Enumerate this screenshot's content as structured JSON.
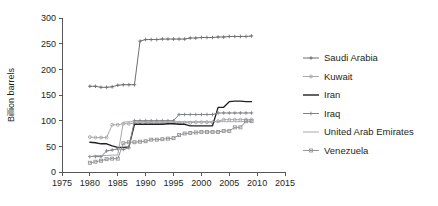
{
  "chart_data": {
    "type": "line",
    "title": "",
    "xlabel": "",
    "ylabel": "Billion barrels",
    "xlim": [
      1975,
      2015
    ],
    "ylim": [
      0,
      300
    ],
    "xticks": [
      1975,
      1980,
      1985,
      1990,
      1995,
      2000,
      2005,
      2010,
      2015
    ],
    "yticks": [
      0,
      50,
      100,
      150,
      200,
      250,
      300
    ],
    "grid": false,
    "legend_position": "right",
    "x": [
      1980,
      1981,
      1982,
      1983,
      1984,
      1985,
      1986,
      1987,
      1988,
      1989,
      1990,
      1991,
      1992,
      1993,
      1994,
      1995,
      1996,
      1997,
      1998,
      1999,
      2000,
      2001,
      2002,
      2003,
      2004,
      2005,
      2006,
      2007,
      2008,
      2009
    ],
    "series": [
      {
        "name": "Saudi Arabia",
        "color": "#6d6e71",
        "marker": "plus",
        "values": [
          167,
          167,
          165,
          165,
          166,
          169,
          170,
          170,
          170,
          255,
          258,
          258,
          258,
          259,
          259,
          259,
          259,
          259,
          261,
          261,
          262,
          262,
          262,
          263,
          263,
          264,
          264,
          264,
          264,
          265
        ]
      },
      {
        "name": "Kuwait",
        "color": "#a7a9ac",
        "marker": "dot",
        "values": [
          68,
          67,
          67,
          67,
          92,
          92,
          94,
          94,
          95,
          97,
          97,
          96,
          96,
          96,
          96,
          96,
          96,
          96,
          96,
          97,
          97,
          97,
          97,
          99,
          102,
          102,
          102,
          102,
          102,
          102
        ]
      },
      {
        "name": "Iran",
        "color": "#231f20",
        "marker": "none",
        "values": [
          58,
          57,
          55,
          55,
          51,
          48,
          48,
          49,
          93,
          93,
          93,
          93,
          93,
          93,
          94,
          94,
          93,
          93,
          90,
          90,
          90,
          90,
          90,
          126,
          126,
          137,
          138,
          138,
          137,
          137
        ]
      },
      {
        "name": "Iraq",
        "color": "#808285",
        "marker": "plus",
        "values": [
          30,
          30,
          30,
          41,
          43,
          45,
          44,
          47,
          100,
          100,
          100,
          100,
          100,
          100,
          100,
          100,
          112,
          112,
          112,
          112,
          112,
          112,
          112,
          115,
          115,
          115,
          115,
          115,
          115,
          115
        ]
      },
      {
        "name": "United Arab Emirates",
        "color": "#a7a9ac",
        "marker": "none",
        "values": [
          30,
          32,
          32,
          32,
          33,
          33,
          97,
          98,
          98,
          98,
          98,
          98,
          98,
          98,
          98,
          98,
          98,
          98,
          98,
          98,
          98,
          98,
          98,
          98,
          98,
          98,
          98,
          98,
          98,
          98
        ]
      },
      {
        "name": "Venezuela",
        "color": "#939598",
        "marker": "square",
        "values": [
          18,
          20,
          22,
          25,
          26,
          26,
          56,
          58,
          58,
          59,
          60,
          63,
          63,
          64,
          65,
          66,
          72,
          75,
          76,
          77,
          78,
          78,
          78,
          78,
          80,
          80,
          87,
          87,
          99,
          99
        ]
      }
    ]
  },
  "axes": {
    "y_label": "Billion barrels",
    "y_ticks": [
      "0",
      "50",
      "100",
      "150",
      "200",
      "250",
      "300"
    ],
    "x_ticks": [
      "1975",
      "1980",
      "1985",
      "1990",
      "1995",
      "2000",
      "2005",
      "2010",
      "2015"
    ]
  },
  "legend": {
    "items": [
      {
        "label": "Saudi Arabia",
        "color": "#6d6e71",
        "marker": "plus"
      },
      {
        "label": "Kuwait",
        "color": "#a7a9ac",
        "marker": "dot"
      },
      {
        "label": "Iran",
        "color": "#231f20",
        "marker": "none"
      },
      {
        "label": "Iraq",
        "color": "#808285",
        "marker": "plus"
      },
      {
        "label": "United Arab Emirates",
        "color": "#a7a9ac",
        "marker": "none"
      },
      {
        "label": "Venezuela",
        "color": "#939598",
        "marker": "square"
      }
    ]
  }
}
